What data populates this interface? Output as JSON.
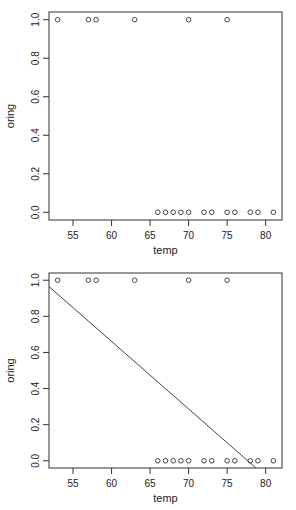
{
  "chart_data": [
    {
      "type": "scatter",
      "title": "",
      "xlabel": "temp",
      "ylabel": "oring",
      "xlim": [
        51.88,
        82.12
      ],
      "ylim": [
        -0.04,
        1.04
      ],
      "xticks": [
        55,
        60,
        65,
        70,
        75,
        80
      ],
      "yticks": [
        0.0,
        0.2,
        0.4,
        0.6,
        0.8,
        1.0
      ],
      "ytick_labels": [
        "0.0",
        "0.2",
        "0.4",
        "0.6",
        "0.8",
        "1.0"
      ],
      "grid": false,
      "points": [
        {
          "x": 53,
          "y": 1
        },
        {
          "x": 57,
          "y": 1
        },
        {
          "x": 58,
          "y": 1
        },
        {
          "x": 63,
          "y": 1
        },
        {
          "x": 70,
          "y": 1
        },
        {
          "x": 75,
          "y": 1
        },
        {
          "x": 66,
          "y": 0
        },
        {
          "x": 67,
          "y": 0
        },
        {
          "x": 68,
          "y": 0
        },
        {
          "x": 69,
          "y": 0
        },
        {
          "x": 70,
          "y": 0
        },
        {
          "x": 72,
          "y": 0
        },
        {
          "x": 73,
          "y": 0
        },
        {
          "x": 75,
          "y": 0
        },
        {
          "x": 76,
          "y": 0
        },
        {
          "x": 78,
          "y": 0
        },
        {
          "x": 79,
          "y": 0
        },
        {
          "x": 81,
          "y": 0
        }
      ]
    },
    {
      "type": "scatter",
      "title": "",
      "xlabel": "temp",
      "ylabel": "oring",
      "xlim": [
        51.88,
        82.12
      ],
      "ylim": [
        -0.04,
        1.04
      ],
      "xticks": [
        55,
        60,
        65,
        70,
        75,
        80
      ],
      "yticks": [
        0.0,
        0.2,
        0.4,
        0.6,
        0.8,
        1.0
      ],
      "ytick_labels": [
        "0.0",
        "0.2",
        "0.4",
        "0.6",
        "0.8",
        "1.0"
      ],
      "grid": false,
      "points": [
        {
          "x": 53,
          "y": 1
        },
        {
          "x": 57,
          "y": 1
        },
        {
          "x": 58,
          "y": 1
        },
        {
          "x": 63,
          "y": 1
        },
        {
          "x": 70,
          "y": 1
        },
        {
          "x": 75,
          "y": 1
        },
        {
          "x": 66,
          "y": 0
        },
        {
          "x": 67,
          "y": 0
        },
        {
          "x": 68,
          "y": 0
        },
        {
          "x": 69,
          "y": 0
        },
        {
          "x": 70,
          "y": 0
        },
        {
          "x": 72,
          "y": 0
        },
        {
          "x": 73,
          "y": 0
        },
        {
          "x": 75,
          "y": 0
        },
        {
          "x": 76,
          "y": 0
        },
        {
          "x": 78,
          "y": 0
        },
        {
          "x": 79,
          "y": 0
        },
        {
          "x": 81,
          "y": 0
        }
      ],
      "fit_line": {
        "intercept": 2.905,
        "slope": -0.0374
      }
    }
  ]
}
